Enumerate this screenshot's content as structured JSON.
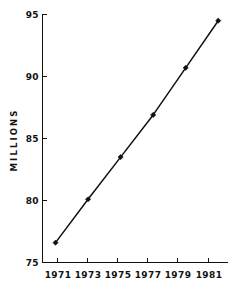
{
  "chart_data": {
    "type": "line",
    "title": "",
    "subtitle": "",
    "xlabel": "",
    "ylabel": "MILLIONS",
    "x": [
      1971,
      1973,
      1975,
      1977,
      1979,
      1981
    ],
    "xtick_labels": [
      "1971",
      "1973",
      "1975",
      "1977",
      "1979",
      "1981"
    ],
    "ytick_labels": [
      "75",
      "80",
      "85",
      "90",
      "95"
    ],
    "ytick_values": [
      75,
      80,
      85,
      90,
      95
    ],
    "values": [
      76.6,
      80.1,
      83.5,
      86.9,
      90.7,
      94.5
    ],
    "series": [
      {
        "name": "MILLIONS",
        "values": [
          76.6,
          80.1,
          83.5,
          86.9,
          90.7,
          94.5
        ]
      }
    ],
    "xlim": [
      1970.2,
      1981.6
    ],
    "ylim": [
      75,
      95
    ],
    "grid": false,
    "legend": false,
    "legend_position": "none",
    "markers": "filled-diamond",
    "line_color": "#111111",
    "marker_color": "#111111",
    "background_color": "#ffffff",
    "annotations": []
  },
  "labels": {
    "y_axis_title": "MILLIONS",
    "ytick_0": "75",
    "ytick_1": "80",
    "ytick_2": "85",
    "ytick_3": "90",
    "ytick_4": "95",
    "xtick_0": "1971",
    "xtick_1": "1973",
    "xtick_2": "1975",
    "xtick_3": "1977",
    "xtick_4": "1979",
    "xtick_5": "1981"
  }
}
